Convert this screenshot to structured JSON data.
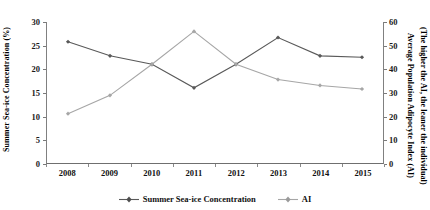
{
  "chart_data": {
    "type": "line",
    "title": "",
    "xlabel": "",
    "categories": [
      "2008",
      "2009",
      "2010",
      "2011",
      "2012",
      "2013",
      "2014",
      "2015"
    ],
    "grid": false,
    "legend_position": "bottom",
    "axes": {
      "left": {
        "label": "Summer Sea-ice Concentration (%)",
        "ticks": [
          0,
          5,
          10,
          15,
          20,
          25,
          30
        ],
        "ylim": [
          0,
          30
        ]
      },
      "right": {
        "label_line1": "Average Population Adipocyte Index (AI)",
        "label_line2": "(The higher the AI, the leaner the individual)",
        "ticks": [
          0,
          10,
          20,
          30,
          40,
          50,
          60
        ],
        "ylim": [
          0,
          60
        ]
      }
    },
    "series": [
      {
        "name": "Summer Sea-ice Concentration",
        "axis": "left",
        "color": "#595959",
        "marker": "diamond",
        "values": [
          25.8,
          22.8,
          21.0,
          16.0,
          21.0,
          26.7,
          22.8,
          22.5
        ]
      },
      {
        "name": "AI",
        "axis": "right",
        "color": "#a6a6a6",
        "marker": "diamond",
        "values": [
          21.0,
          28.8,
          42.0,
          56.0,
          42.0,
          35.5,
          33.0,
          31.5
        ]
      }
    ]
  },
  "legend": {
    "entries": [
      {
        "label": "Summer Sea-ice Concentration"
      },
      {
        "label": "AI"
      }
    ]
  }
}
